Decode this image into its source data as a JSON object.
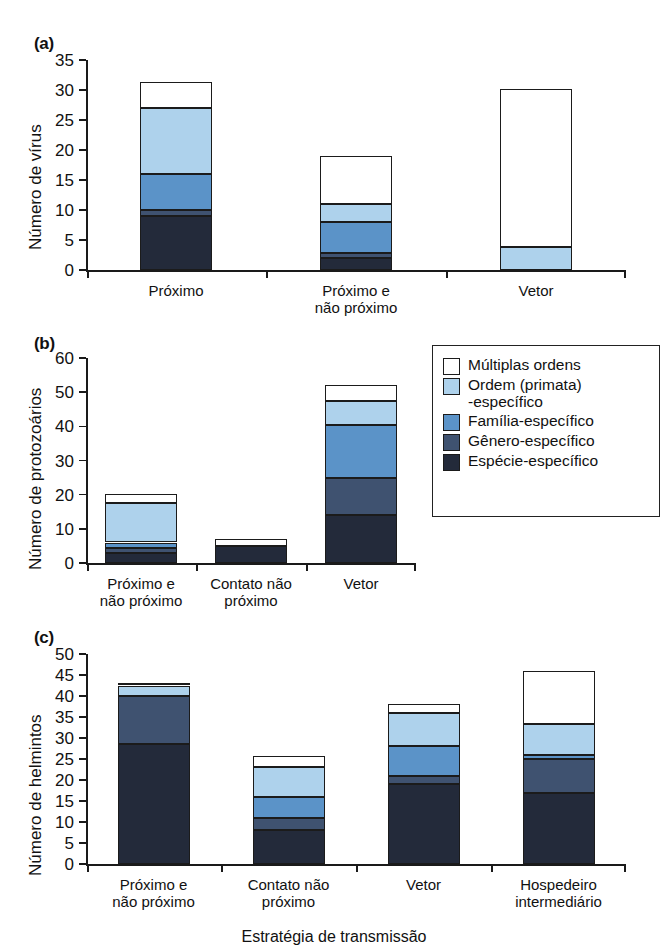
{
  "figure": {
    "x_axis_title": "Estratégia de transmissão"
  },
  "legend": {
    "name": "legend-box",
    "items": [
      {
        "label": "Múltiplas ordens",
        "color": "#ffffff",
        "key": "multiplas"
      },
      {
        "label": "Ordem (primata)\n-específico",
        "color": "#aed2ec",
        "key": "ordem"
      },
      {
        "label": "Família-específico",
        "color": "#5b93c8",
        "key": "familia"
      },
      {
        "label": "Gênero-específico",
        "color": "#3f5270",
        "key": "genero"
      },
      {
        "label": "Espécie-específico",
        "color": "#232a3a",
        "key": "especie"
      }
    ]
  },
  "chart_data": [
    {
      "type": "bar",
      "panel": "(a)",
      "title": "",
      "xlabel": "",
      "ylabel": "Número de vírus",
      "ylim": [
        0,
        35
      ],
      "yticks": [
        0,
        5,
        10,
        15,
        20,
        25,
        30,
        35
      ],
      "grid": false,
      "stacked": true,
      "legend_position": "right",
      "categories": [
        "Próximo",
        "Próximo e\nnão próximo",
        "Vetor"
      ],
      "series": [
        {
          "name": "Espécie-específico",
          "values": [
            9,
            2,
            0
          ]
        },
        {
          "name": "Gênero-específico",
          "values": [
            1,
            0.8,
            0
          ]
        },
        {
          "name": "Família-específico",
          "values": [
            6,
            5.2,
            0
          ]
        },
        {
          "name": "Ordem (primata)-específico",
          "values": [
            11,
            3,
            3.8
          ]
        },
        {
          "name": "Múltiplas ordens",
          "values": [
            4.3,
            8,
            26.4
          ]
        }
      ],
      "totals": [
        31.3,
        19,
        30.2
      ]
    },
    {
      "type": "bar",
      "panel": "(b)",
      "title": "",
      "xlabel": "",
      "ylabel": "Número de protozoários",
      "ylim": [
        0,
        60
      ],
      "yticks": [
        0,
        10,
        20,
        30,
        40,
        50,
        60
      ],
      "grid": false,
      "stacked": true,
      "legend_position": "right",
      "categories": [
        "Próximo e\nnão próximo",
        "Contato não\npróximo",
        "Vetor"
      ],
      "series": [
        {
          "name": "Espécie-específico",
          "values": [
            3,
            5,
            14
          ]
        },
        {
          "name": "Gênero-específico",
          "values": [
            1.5,
            0,
            11
          ]
        },
        {
          "name": "Família-específico",
          "values": [
            1.5,
            0,
            15.3
          ]
        },
        {
          "name": "Ordem (primata)-específico",
          "values": [
            11.5,
            0,
            7
          ]
        },
        {
          "name": "Múltiplas ordens",
          "values": [
            2.7,
            2,
            4.7
          ]
        }
      ],
      "totals": [
        20.2,
        7,
        52
      ]
    },
    {
      "type": "bar",
      "panel": "(c)",
      "title": "",
      "xlabel": "Estratégia de transmissão",
      "ylabel": "Número de helmintos",
      "ylim": [
        0,
        50
      ],
      "yticks": [
        0,
        5,
        10,
        15,
        20,
        25,
        30,
        35,
        40,
        45,
        50
      ],
      "grid": false,
      "stacked": true,
      "legend_position": "none",
      "categories": [
        "Próximo e\nnão próximo",
        "Contato não\npróximo",
        "Vetor",
        "Hospedeiro\nintermediário"
      ],
      "series": [
        {
          "name": "Espécie-específico",
          "values": [
            28.5,
            8,
            19,
            17
          ]
        },
        {
          "name": "Gênero-específico",
          "values": [
            11.5,
            3,
            2,
            8
          ]
        },
        {
          "name": "Família-específico",
          "values": [
            0,
            5,
            7,
            1
          ]
        },
        {
          "name": "Ordem (primata)-específico",
          "values": [
            2.5,
            7,
            8,
            7.3
          ]
        },
        {
          "name": "Múltiplas ordens",
          "values": [
            0.5,
            2.7,
            2,
            12.7
          ]
        }
      ],
      "totals": [
        43,
        25.7,
        38,
        46
      ]
    }
  ]
}
